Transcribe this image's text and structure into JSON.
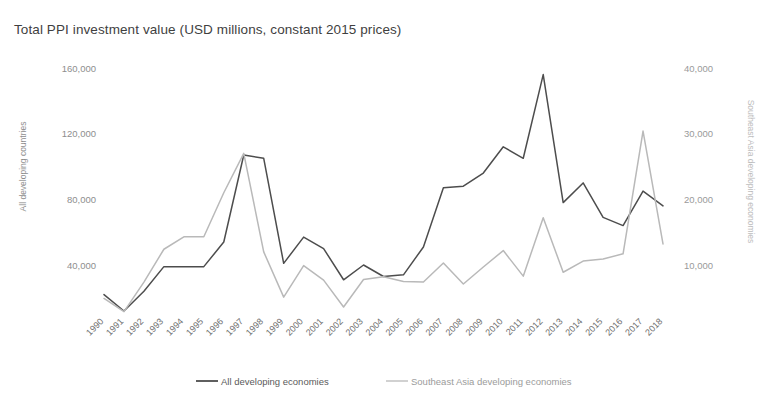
{
  "title": "Total PPI investment value (USD millions, constant 2015 prices)",
  "colors": {
    "series_all": "#4d4d4d",
    "series_sea": "#b9b9b9",
    "tick_text": "#8e8e8e",
    "title_text": "#3f3f3f"
  },
  "axes": {
    "left": {
      "title": "All developing countries",
      "ticks": [
        "160,000",
        "120,000",
        "80,000",
        "40,000"
      ],
      "tick_values": [
        160000,
        120000,
        80000,
        40000
      ],
      "min": 0,
      "max": 160000
    },
    "right": {
      "title": "Southeast Asia developing economies",
      "ticks": [
        "40,000",
        "30,000",
        "20,000",
        "10,000"
      ],
      "tick_values": [
        40000,
        30000,
        20000,
        10000
      ],
      "min": 0,
      "max": 40000
    }
  },
  "legend": {
    "items": [
      {
        "label": "All developing economies",
        "color": "#4d4d4d"
      },
      {
        "label": "Southeast Asia developing economies",
        "color": "#b9b9b9"
      }
    ]
  },
  "chart_data": {
    "type": "line",
    "title": "Total PPI investment value (USD millions, constant 2015 prices)",
    "xlabel": "",
    "ylabel": "All developing countries",
    "y2label": "Southeast Asia developing economies",
    "ylim": [
      0,
      160000
    ],
    "y2lim": [
      0,
      40000
    ],
    "grid": false,
    "legend_position": "bottom",
    "categories": [
      "1990",
      "1991",
      "1992",
      "1993",
      "1994",
      "1995",
      "1996",
      "1997",
      "1998",
      "1999",
      "2000",
      "2001",
      "2002",
      "2003",
      "2004",
      "2005",
      "2006",
      "2007",
      "2008",
      "2009",
      "2010",
      "2011",
      "2012",
      "2013",
      "2014",
      "2015",
      "2016",
      "2017",
      "2018"
    ],
    "series": [
      {
        "name": "All developing economies",
        "axis": "left",
        "color": "#4d4d4d",
        "values": [
          22000,
          12000,
          24000,
          39000,
          39000,
          39000,
          54000,
          107000,
          105000,
          41000,
          57000,
          50000,
          31000,
          40000,
          33000,
          34000,
          51000,
          87000,
          88000,
          96000,
          112000,
          105000,
          156000,
          78000,
          90000,
          69000,
          64000,
          85000,
          76000
        ]
      },
      {
        "name": "Southeast Asia developing economies",
        "axis": "right",
        "color": "#b9b9b9",
        "values": [
          4900,
          2900,
          7400,
          12400,
          14300,
          14300,
          21000,
          27000,
          12000,
          5100,
          9900,
          7700,
          3600,
          7800,
          8200,
          7500,
          7400,
          10300,
          7100,
          9700,
          12200,
          8300,
          17200,
          8900,
          10600,
          10900,
          11700,
          30400,
          13200
        ]
      }
    ]
  }
}
